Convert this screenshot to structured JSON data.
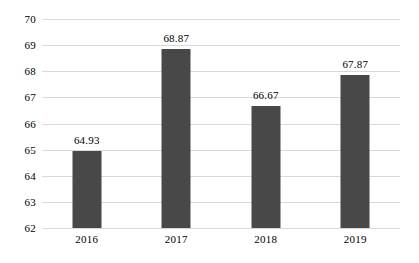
{
  "chart_data": {
    "type": "bar",
    "title": "",
    "subtitle": "",
    "xlabel": "",
    "ylabel": "",
    "categories": [
      "2016",
      "2017",
      "2018",
      "2019"
    ],
    "values": [
      64.93,
      68.87,
      66.67,
      67.87
    ],
    "data_labels": [
      "64.93",
      "68.87",
      "66.67",
      "67.87"
    ],
    "ylim": [
      62,
      70
    ],
    "ytick_labels": [
      "70",
      "69",
      "68",
      "67",
      "66",
      "65",
      "64",
      "63",
      "62"
    ],
    "ytick_values": [
      70,
      69,
      68,
      67,
      66,
      65,
      64,
      63,
      62
    ],
    "grid": true,
    "grid_axis": "y",
    "legend": false,
    "legend_position": "none",
    "colors": {
      "bar": "#484848",
      "gridline": "#d9d9d9",
      "background": "#ffffff",
      "text": "#000000"
    }
  }
}
